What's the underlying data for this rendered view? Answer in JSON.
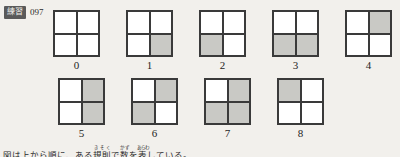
{
  "header": {
    "badge_label": "練習",
    "exercise_number": "097"
  },
  "colors": {
    "background": "#f2f0ec",
    "grid_line": "#3a3a3a",
    "cell_empty": "#ffffff",
    "cell_filled": "#c9c9c5",
    "badge_background": "#5a5a5a",
    "badge_text": "#f2f0ec",
    "text": "#1e1e1e"
  },
  "puzzle": {
    "cell_positions": [
      "top-left",
      "top-right",
      "bottom-left",
      "bottom-right"
    ],
    "rows": [
      {
        "items": [
          {
            "label": "0",
            "cells": [
              false,
              false,
              false,
              false
            ]
          },
          {
            "label": "1",
            "cells": [
              false,
              false,
              false,
              true
            ]
          },
          {
            "label": "2",
            "cells": [
              false,
              false,
              true,
              false
            ]
          },
          {
            "label": "3",
            "cells": [
              false,
              false,
              true,
              true
            ]
          },
          {
            "label": "4",
            "cells": [
              false,
              true,
              false,
              false
            ]
          }
        ]
      },
      {
        "items": [
          {
            "label": "5",
            "cells": [
              false,
              true,
              false,
              true
            ]
          },
          {
            "label": "6",
            "cells": [
              false,
              true,
              true,
              false
            ]
          },
          {
            "label": "7",
            "cells": [
              false,
              true,
              true,
              true
            ]
          },
          {
            "label": "8",
            "cells": [
              true,
              false,
              false,
              false
            ]
          }
        ]
      }
    ]
  },
  "footer": {
    "caption_html": "図は上から順に、ある<ruby>規則<rt>きそく</rt></ruby>で<ruby>数<rt>かず</rt></ruby>を<ruby>表<rt>あらわ</rt></ruby>している。",
    "caption_text": "図は上から順に、ある規則で数を表している。"
  }
}
